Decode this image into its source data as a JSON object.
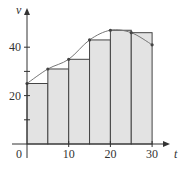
{
  "chart_data": {
    "type": "bar",
    "title": "",
    "xlabel": "t",
    "ylabel": "v",
    "x_ticks": [
      0,
      10,
      20,
      30
    ],
    "x_tick_labels": [
      "0",
      "10",
      "20",
      "30"
    ],
    "y_ticks": [
      20,
      40
    ],
    "y_tick_labels": [
      "20",
      "40"
    ],
    "y_minor_ticks": [
      10,
      30
    ],
    "xlim": [
      0,
      33
    ],
    "ylim": [
      0,
      55
    ],
    "grid": false,
    "bar_width": 5,
    "bars": [
      {
        "left": 0,
        "right": 5,
        "height": 25
      },
      {
        "left": 5,
        "right": 10,
        "height": 31
      },
      {
        "left": 10,
        "right": 15,
        "height": 35
      },
      {
        "left": 15,
        "right": 20,
        "height": 43
      },
      {
        "left": 20,
        "right": 25,
        "height": 47
      },
      {
        "left": 25,
        "right": 30,
        "height": 46
      }
    ],
    "curve_points": [
      {
        "t": 0,
        "v": 25
      },
      {
        "t": 5,
        "v": 31
      },
      {
        "t": 10,
        "v": 35
      },
      {
        "t": 15,
        "v": 43
      },
      {
        "t": 20,
        "v": 47
      },
      {
        "t": 25,
        "v": 46
      },
      {
        "t": 30,
        "v": 41
      }
    ],
    "colors": {
      "bar_fill": "#e3e3e3",
      "bar_stroke": "#444444",
      "curve": "#777777",
      "axis": "#333333"
    }
  }
}
